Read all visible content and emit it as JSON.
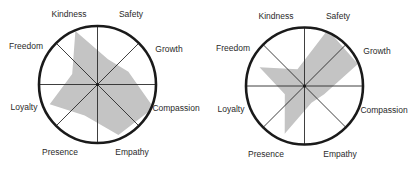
{
  "chart_data": [
    {
      "type": "radar",
      "title": "",
      "categories": [
        "Kindness",
        "Safety",
        "Growth",
        "Compassion",
        "Empathy",
        "Presence",
        "Loyalty",
        "Freedom"
      ],
      "values": [
        0.95,
        0.45,
        0.55,
        1.0,
        0.9,
        0.55,
        0.85,
        0.45
      ],
      "value_scale": "fraction of circle radius (0-1)",
      "values_note": "No rings or tick marks in the figure; values are estimates read from the shaded area, approx +/-0.1",
      "grid": "8 spokes, outer circle only",
      "fill_color": "#c4c4c4"
    },
    {
      "type": "radar",
      "title": "",
      "categories": [
        "Kindness",
        "Safety",
        "Growth",
        "Compassion",
        "Empathy",
        "Presence",
        "Loyalty",
        "Freedom"
      ],
      "values": [
        0.3,
        1.0,
        0.95,
        0.35,
        0.3,
        0.85,
        0.35,
        0.8
      ],
      "value_scale": "fraction of circle radius (0-1)",
      "values_note": "No rings or tick marks in the figure; values are estimates read from the shaded area, approx +/-0.1",
      "grid": "8 spokes, outer circle only",
      "fill_color": "#c4c4c4"
    }
  ],
  "charts": [
    {
      "labels": {
        "kindness": "Kindness",
        "safety": "Safety",
        "growth": "Growth",
        "compassion": "Compassion",
        "empathy": "Empathy",
        "presence": "Presence",
        "loyalty": "Loyalty",
        "freedom": "Freedom"
      }
    },
    {
      "labels": {
        "kindness": "Kindness",
        "safety": "Safety",
        "growth": "Growth",
        "compassion": "Compassion",
        "empathy": "Empathy",
        "presence": "Presence",
        "loyalty": "Loyalty",
        "freedom": "Freedom"
      }
    }
  ],
  "style": {
    "stroke": "#1a1a1a",
    "spoke": "#2a2a2a",
    "fill": "#c4c4c4"
  }
}
